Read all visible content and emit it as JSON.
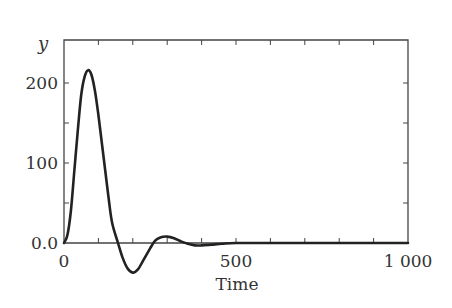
{
  "chart_data": {
    "type": "line",
    "title": "",
    "xlabel": "Time",
    "ylabel": "y",
    "xlim": [
      0,
      1000
    ],
    "ylim": [
      -50,
      250
    ],
    "grid": false,
    "legend": null,
    "x_ticks": [
      {
        "value": 0,
        "label": "0"
      },
      {
        "value": 500,
        "label": "500"
      },
      {
        "value": 1000,
        "label": "1 000"
      }
    ],
    "x_minor_ticks": [
      100,
      200,
      300,
      400,
      600,
      700,
      800,
      900
    ],
    "y_ticks": [
      {
        "value": 0,
        "label": "0.0"
      },
      {
        "value": 100,
        "label": "100"
      },
      {
        "value": 200,
        "label": "200"
      }
    ],
    "y_minor_ticks": [
      50,
      150
    ],
    "series": [
      {
        "name": "y",
        "color": "#222222",
        "x": [
          0,
          10,
          20,
          30,
          40,
          50,
          60,
          70,
          80,
          90,
          100,
          110,
          120,
          130,
          140,
          157,
          170,
          185,
          200,
          215,
          230,
          250,
          265,
          280,
          300,
          320,
          340,
          360,
          380,
          400,
          430,
          460,
          500,
          600,
          700,
          800,
          900,
          1000
        ],
        "values": [
          0,
          10,
          40,
          90,
          140,
          185,
          208,
          216,
          210,
          190,
          160,
          125,
          90,
          55,
          25,
          0,
          -18,
          -32,
          -37,
          -33,
          -22,
          -7,
          3,
          7,
          8,
          6,
          2,
          -1,
          -3,
          -3,
          -2,
          -1,
          0,
          0,
          0,
          0,
          0,
          0
        ]
      }
    ]
  },
  "axes": {
    "frame_color": "#444444",
    "x_axis_at_zero": true
  }
}
